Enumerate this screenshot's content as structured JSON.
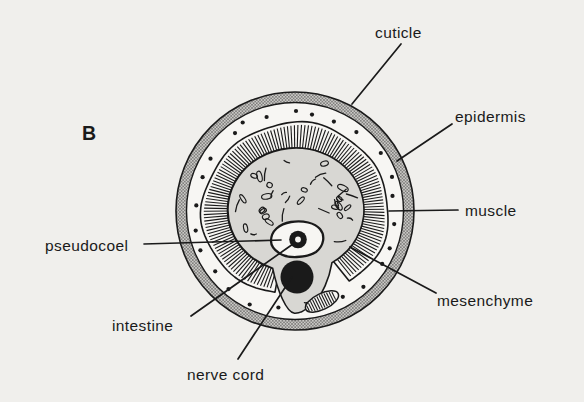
{
  "figure": {
    "panel_letter": "B",
    "labels": {
      "cuticle": "cuticle",
      "epidermis": "epidermis",
      "muscle": "muscle",
      "pseudocoel": "pseudocoel",
      "intestine": "intestine",
      "nerve_cord": "nerve cord",
      "mesenchyme": "mesenchyme"
    },
    "colors": {
      "ink": "#1a1a1a",
      "background": "#f0efec",
      "body_fill": "#f7f6f3",
      "mesenchyme_fill": "#d8d7d3",
      "cuticle_base": "#cbcac7",
      "cuticle_dot": "#5f5e5c"
    }
  }
}
